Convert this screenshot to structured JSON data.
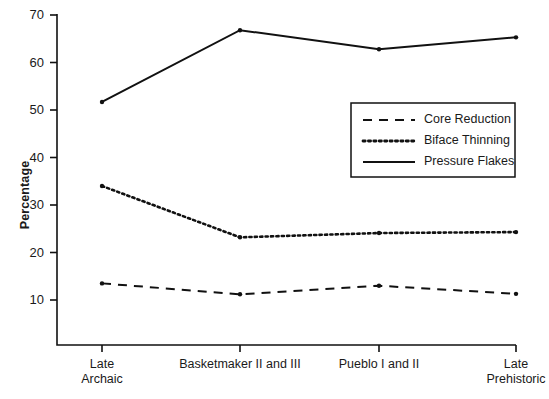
{
  "chart_data": {
    "type": "line",
    "title": "",
    "subtitle": "",
    "xlabel": "",
    "ylabel": "Percentage",
    "ylim": [
      5,
      70
    ],
    "yticks": [
      10,
      20,
      30,
      40,
      50,
      60,
      70
    ],
    "ytick_labels": [
      "10",
      "20",
      "30",
      "40",
      "50",
      "60",
      "70"
    ],
    "grid": false,
    "legend_position": "upper right",
    "categories": [
      "Late Archaic",
      "Basketmaker II and III",
      "Pueblo I and II",
      "Late Prehistoric"
    ],
    "category_lines": [
      [
        "Late",
        "Archaic"
      ],
      [
        "Basketmaker II and III"
      ],
      [
        "Pueblo I and II"
      ],
      [
        "Late",
        "Prehistoric"
      ]
    ],
    "series": [
      {
        "name": "Core Reduction",
        "style": "dashed",
        "color": "#111111",
        "values": [
          13.5,
          11.2,
          13.0,
          11.3
        ]
      },
      {
        "name": "Biface Thinning",
        "style": "dotted",
        "color": "#111111",
        "values": [
          34.0,
          23.2,
          24.1,
          24.3
        ]
      },
      {
        "name": "Pressure Flakes",
        "style": "solid",
        "color": "#111111",
        "values": [
          51.7,
          66.8,
          62.8,
          65.3
        ]
      }
    ]
  },
  "legend": {
    "entries": [
      {
        "label": "Core Reduction",
        "style": "dashed"
      },
      {
        "label": "Biface Thinning",
        "style": "dotted"
      },
      {
        "label": "Pressure Flakes",
        "style": "solid"
      }
    ]
  },
  "axes": {
    "y_title": "Percentage"
  }
}
